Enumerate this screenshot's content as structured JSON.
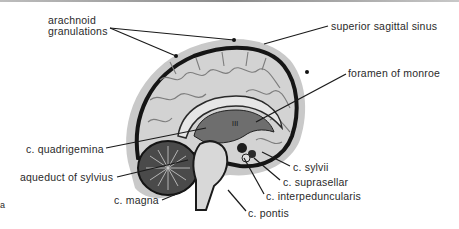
{
  "diagram": {
    "colors": {
      "meninges_outer": "#c4c4c4",
      "sinus": "#1e1e1e",
      "cortex": "#cfcfcf",
      "gyri_lines": "#7a7a7a",
      "ventricle": "#6e6e6e",
      "cerebellum": "#3a3a3a",
      "brainstem": "#d6d6d6",
      "label_text": "#2a2a2a",
      "leader_lines": "#1a1a1a"
    },
    "labels": {
      "arachnoid_granulations": "arachnoid\ngranulations",
      "superior_sagittal_sinus": "superior sagittal sinus",
      "foramen_of_monroe": "foramen of monroe",
      "c_quadrigemina": "c. quadrigemina",
      "aqueduct_of_sylvius": "aqueduct of sylvius",
      "c_magna": "c. magna",
      "c_sylvii": "c. sylvii",
      "c_suprasellar": "c. suprasellar",
      "c_interpeduncularis": "c. interpeduncularis",
      "c_pontis": "c. pontis",
      "ventricle_mark": "III",
      "edge_fragment": "a"
    }
  }
}
